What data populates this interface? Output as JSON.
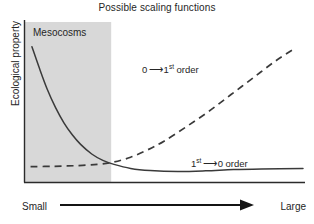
{
  "chart_data": {
    "type": "line",
    "title": "Possible scaling functions",
    "xlabel": "",
    "ylabel": "Ecological property",
    "xlim": [
      0,
      1
    ],
    "ylim": [
      0,
      1
    ],
    "grid": false,
    "legend": "none",
    "x_axis_low_label": "Small",
    "x_axis_high_label": "Large",
    "shaded_region": {
      "label": "Mesocosms",
      "x_start": 0.0,
      "x_end": 0.31,
      "color": "#d8d8d8"
    },
    "annotations": [
      {
        "id": "decay-to-growth",
        "prefix": "0",
        "arrow": "—→",
        "suffix_sup": "",
        "suffix": "1",
        "order_sup": "st",
        "order_text": " order",
        "full_text": "0 ⟶ 1st order",
        "x": 0.46,
        "y": 0.74
      },
      {
        "id": "growth-to-plateau",
        "prefix": "1",
        "prefix_sup": "st",
        "arrow": "—→",
        "suffix": "0 order",
        "full_text": "1st ⟶ 0 order",
        "x": 0.64,
        "y": 0.16
      }
    ],
    "series": [
      {
        "name": "1st order to 0 order (solid, decaying curve)",
        "style": "solid",
        "color": "#3a3a3a",
        "x": [
          0.025,
          0.05,
          0.08,
          0.11,
          0.14,
          0.17,
          0.2,
          0.24,
          0.28,
          0.32,
          0.38,
          0.45,
          0.55,
          0.65,
          0.75,
          0.85,
          1.0
        ],
        "y": [
          0.845,
          0.72,
          0.58,
          0.465,
          0.37,
          0.295,
          0.235,
          0.175,
          0.135,
          0.11,
          0.085,
          0.072,
          0.066,
          0.07,
          0.078,
          0.082,
          0.085
        ]
      },
      {
        "name": "0 order to 1st order (dashed, rising curve)",
        "style": "dashed",
        "color": "#3a3a3a",
        "x": [
          0.02,
          0.1,
          0.18,
          0.26,
          0.32,
          0.38,
          0.44,
          0.5,
          0.58,
          0.66,
          0.74,
          0.82,
          0.9,
          0.975
        ],
        "y": [
          0.096,
          0.098,
          0.102,
          0.11,
          0.125,
          0.155,
          0.2,
          0.255,
          0.345,
          0.44,
          0.545,
          0.65,
          0.755,
          0.84
        ]
      }
    ]
  }
}
